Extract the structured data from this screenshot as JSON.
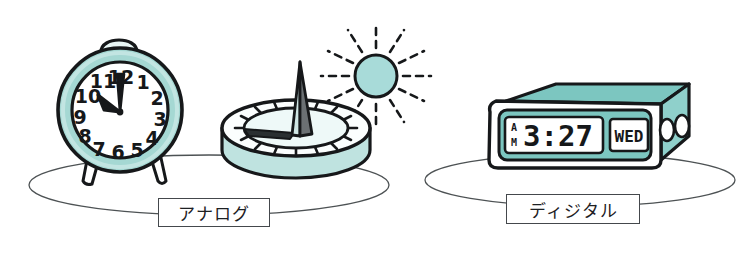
{
  "figure": {
    "background_color": "#ffffff",
    "width": 753,
    "height": 260
  },
  "palette": {
    "teal_light": "#bfe3e0",
    "teal_mid": "#a5d8d3",
    "teal_deep": "#7ec6c0",
    "sun_fill": "#a8dbd9",
    "ink": "#16181a",
    "outline": "#1d2023",
    "white": "#ffffff",
    "shadow_gray": "#4a4f52",
    "ground_line": "#4d5254"
  },
  "labels": {
    "analog": "アナログ",
    "digital": "ディジタル"
  },
  "analog_clock": {
    "name": "alarm-clock",
    "face_numerals": [
      "12",
      "1",
      "2",
      "3",
      "4",
      "5",
      "6",
      "7",
      "8",
      "9",
      "10",
      "11"
    ],
    "hour_hand_points_to": "10",
    "minute_hand_points_to": "12",
    "time_shown": "10:00",
    "bell_count": 1,
    "foot_count": 2,
    "body_color": "#a5d8d3",
    "face_color": "#ffffff"
  },
  "sundial": {
    "name": "sundial",
    "gnomon": "triangular gnomon",
    "shadow_direction": "west",
    "tick_count": 16,
    "base_color": "#bfe3e0",
    "dial_color": "#f2fbfa"
  },
  "sun": {
    "name": "sun",
    "fill": "#a8dbd9",
    "ray_count": 12,
    "ray_style": "dashed"
  },
  "digital_clock": {
    "name": "digital-alarm-clock",
    "display": {
      "meridiem_top": "A",
      "meridiem_bottom": "M",
      "time": "3:27",
      "weekday": "WED"
    },
    "button_count": 2,
    "body_color": "#8fd0cb",
    "display_panel_color": "#7cc6c0",
    "lcd_color": "#ffffff"
  },
  "ground": {
    "left_ellipse_label": "analog-group-ground",
    "right_ellipse_label": "digital-group-ground"
  }
}
